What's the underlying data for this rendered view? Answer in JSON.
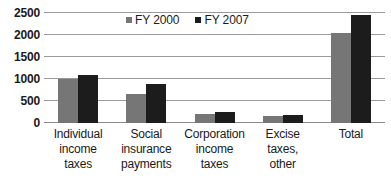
{
  "chart_data": {
    "type": "bar",
    "title": "",
    "subtitle": "",
    "xlabel": "",
    "ylabel": "",
    "ylim": [
      0,
      2500
    ],
    "ytick_labels": [
      "0",
      "500",
      "1000",
      "1500",
      "2000",
      "2500"
    ],
    "ytick_values": [
      0,
      500,
      1000,
      1500,
      2000,
      2500
    ],
    "grid": true,
    "legend_position": "top-center",
    "categories": [
      "Individual income taxes",
      "Social insurance payments",
      "Corporation income taxes",
      "Excise taxes, other",
      "Total"
    ],
    "category_label_lines": [
      [
        "Individual",
        "income",
        "taxes"
      ],
      [
        "Social",
        "insurance",
        "payments"
      ],
      [
        "Corporation",
        "income",
        "taxes"
      ],
      [
        "Excise",
        "taxes,",
        "other"
      ],
      [
        "Total"
      ]
    ],
    "series": [
      {
        "name": "FY 2000",
        "color": "#767676",
        "values": [
          1000,
          650,
          210,
          170,
          2050
        ]
      },
      {
        "name": "FY 2007",
        "color": "#1c1c1c",
        "values": [
          1100,
          880,
          260,
          190,
          2450
        ]
      }
    ]
  },
  "legend": {
    "entries": [
      {
        "label": "FY 2000",
        "swatch": "legend-swatch-series-0"
      },
      {
        "label": "FY 2007",
        "swatch": "legend-swatch-series-1"
      }
    ]
  },
  "colors": {
    "series_0": "#767676",
    "series_1": "#1c1c1c",
    "gridline": "#9a9a9a",
    "text": "#1a1a1a",
    "background": "#ffffff"
  }
}
